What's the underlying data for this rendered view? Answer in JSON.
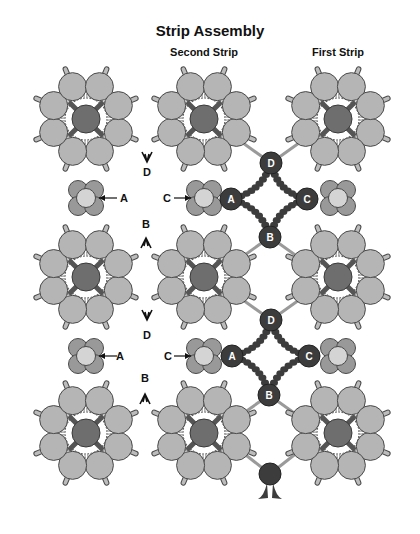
{
  "title": "Strip Assembly",
  "strips": [
    {
      "label": "Second Strip",
      "x": 204
    },
    {
      "label": "First Strip",
      "x": 338
    }
  ],
  "colors": {
    "outer_circle": "#b5b5b5",
    "center_circle": "#6e6e6e",
    "junction_petal": "#999999",
    "junction_core": "#d4d4d4",
    "connector_node": "#3c3c3c",
    "connector_bead": "#3c3c3c",
    "stroke": "#4a4a4a",
    "bead_ring": "#c8c8c8",
    "line": "#9a9a9a"
  },
  "hub_columns": [
    86,
    204,
    338
  ],
  "hub_rows": [
    119,
    277,
    433
  ],
  "junction_rows": [
    198,
    356
  ],
  "connectors": [
    {
      "nodes": [
        {
          "label": "D",
          "x": 271,
          "y": 163
        },
        {
          "label": "A",
          "x": 231,
          "y": 199
        },
        {
          "label": "C",
          "x": 307,
          "y": 199
        },
        {
          "label": "B",
          "x": 270,
          "y": 237
        }
      ]
    },
    {
      "nodes": [
        {
          "label": "D",
          "x": 271,
          "y": 320
        },
        {
          "label": "A",
          "x": 232,
          "y": 356
        },
        {
          "label": "C",
          "x": 309,
          "y": 356
        },
        {
          "label": "B",
          "x": 269,
          "y": 395
        }
      ]
    }
  ],
  "partial_node": {
    "x": 270,
    "y": 474
  },
  "annotations": [
    {
      "text": "D",
      "x": 147,
      "y": 172
    },
    {
      "text": "A",
      "x": 124,
      "y": 198
    },
    {
      "text": "C",
      "x": 167,
      "y": 198
    },
    {
      "text": "B",
      "x": 146,
      "y": 224
    },
    {
      "text": "D",
      "x": 147,
      "y": 335
    },
    {
      "text": "A",
      "x": 120,
      "y": 356
    },
    {
      "text": "C",
      "x": 168,
      "y": 356
    },
    {
      "text": "B",
      "x": 145,
      "y": 378
    }
  ]
}
